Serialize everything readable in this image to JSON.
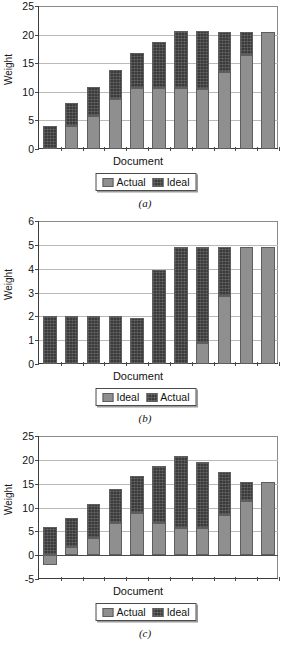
{
  "figure": {
    "panels": [
      {
        "caption": "(a)",
        "ylabel": "Weight",
        "xlabel": "Document",
        "legend": [
          {
            "label": "Actual",
            "swatch": "actual"
          },
          {
            "label": "Ideal",
            "swatch": "ideal"
          }
        ]
      },
      {
        "caption": "(b)",
        "ylabel": "Weight",
        "xlabel": "Document",
        "legend": [
          {
            "label": "Ideal",
            "swatch": "actual"
          },
          {
            "label": "Actual",
            "swatch": "ideal"
          }
        ]
      },
      {
        "caption": "(c)",
        "ylabel": "Weight",
        "xlabel": "Document",
        "legend": [
          {
            "label": "Actual",
            "swatch": "actual"
          },
          {
            "label": "Ideal",
            "swatch": "ideal"
          }
        ]
      }
    ]
  },
  "chart_data": [
    {
      "type": "bar",
      "subtype": "stacked",
      "title": "(a)",
      "xlabel": "Document",
      "ylabel": "Weight",
      "ylim": [
        0,
        25
      ],
      "yticks": [
        0,
        5,
        10,
        15,
        20,
        25
      ],
      "grid": true,
      "legend_position": "below",
      "categories": [
        "1",
        "2",
        "3",
        "4",
        "5",
        "6",
        "7",
        "8",
        "9",
        "10"
      ],
      "series": [
        {
          "name": "Actual",
          "color": "#8f8f8f",
          "values": [
            0,
            4,
            5.8,
            8.8,
            10.6,
            10.6,
            10.6,
            10.5,
            13.4,
            16.4,
            20.5
          ]
        },
        {
          "name": "Ideal",
          "color": "#3b3b3b",
          "values": [
            4,
            4,
            5,
            5,
            6.1,
            8.1,
            10,
            10.1,
            7.1,
            4.1,
            0
          ]
        }
      ],
      "bar_totals": [
        4,
        8,
        10.8,
        13.8,
        16.7,
        18.7,
        20.6,
        20.6,
        20.5,
        20.5,
        20.5
      ]
    },
    {
      "type": "bar",
      "subtype": "stacked",
      "title": "(b)",
      "xlabel": "Document",
      "ylabel": "Weight",
      "ylim": [
        0,
        6
      ],
      "yticks": [
        0,
        1,
        2,
        3,
        4,
        5,
        6
      ],
      "grid": true,
      "legend_position": "below",
      "categories": [
        "1",
        "2",
        "3",
        "4",
        "5",
        "6",
        "7",
        "8",
        "9",
        "10"
      ],
      "series": [
        {
          "name": "Ideal",
          "color": "#8f8f8f",
          "values": [
            0,
            0,
            0,
            0,
            0,
            0,
            0,
            0.9,
            2.85,
            4.9,
            4.9
          ]
        },
        {
          "name": "Actual",
          "color": "#3b3b3b",
          "values": [
            2,
            2,
            2,
            2,
            1.95,
            3.95,
            4.9,
            4.0,
            2.05,
            0,
            0
          ]
        }
      ],
      "bar_totals": [
        2,
        2,
        2,
        2,
        1.95,
        3.95,
        4.9,
        4.9,
        4.9,
        4.9,
        4.9
      ]
    },
    {
      "type": "bar",
      "subtype": "stacked",
      "title": "(c)",
      "xlabel": "Document",
      "ylabel": "Weight",
      "ylim": [
        -5,
        25
      ],
      "yticks": [
        -5,
        0,
        5,
        10,
        15,
        20,
        25
      ],
      "grid": true,
      "legend_position": "below",
      "categories": [
        "1",
        "2",
        "3",
        "4",
        "5",
        "6",
        "7",
        "8",
        "9",
        "10"
      ],
      "series": [
        {
          "name": "Actual",
          "color": "#8f8f8f",
          "base": [
            -2,
            0,
            0,
            0,
            0,
            0,
            0,
            0,
            0,
            0,
            0
          ],
          "values": [
            2,
            1.8,
            3.6,
            6.8,
            8.8,
            6.7,
            5.6,
            5.6,
            8.4,
            11.4,
            15.4
          ]
        },
        {
          "name": "Ideal",
          "color": "#3b3b3b",
          "values": [
            6,
            6,
            7.2,
            7,
            7.9,
            12,
            15.1,
            13.9,
            9.1,
            4,
            0
          ]
        }
      ],
      "bar_totals": [
        6,
        7.8,
        10.8,
        13.8,
        16.7,
        18.7,
        20.7,
        19.5,
        17.5,
        15.4,
        15.4
      ]
    }
  ]
}
